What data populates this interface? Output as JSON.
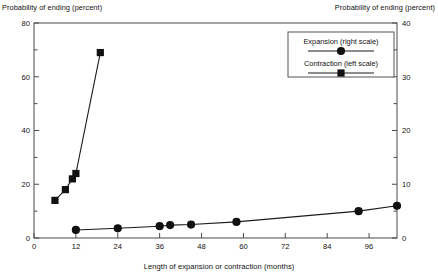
{
  "chart_data": {
    "type": "line",
    "title": "",
    "subtitle": "",
    "xlabel": "Length of expansion or contraction (months)",
    "ylabel_left": "Probability of ending (percent)",
    "ylabel_right": "Probability of ending (percent)",
    "xlim": [
      0,
      104
    ],
    "xticks": [
      0,
      12,
      24,
      36,
      48,
      60,
      72,
      84,
      96
    ],
    "xticklabels": [
      "0",
      "12",
      "24",
      "36",
      "48",
      "60",
      "72",
      "84",
      "96"
    ],
    "ylim_left": [
      0,
      80
    ],
    "yticks_left": [
      0,
      20,
      40,
      60,
      80
    ],
    "yticklabels_left": [
      "0",
      "20",
      "40",
      "60",
      "80"
    ],
    "yminor_left": [
      10,
      30,
      50,
      70
    ],
    "ylim_right": [
      0,
      40
    ],
    "yticks_right": [
      0,
      10,
      20,
      30,
      40
    ],
    "yticklabels_right": [
      "0",
      "10",
      "20",
      "30",
      "40"
    ],
    "yminor_right": [
      5,
      15,
      25,
      35
    ],
    "grid": false,
    "legend_position": "top-right",
    "series": [
      {
        "name": "Expansion (right scale)",
        "axis": "right",
        "marker": "circle",
        "x": [
          12,
          24,
          36,
          39,
          45,
          58,
          93,
          104
        ],
        "values": [
          1.5,
          1.8,
          2.2,
          2.4,
          2.5,
          3.0,
          5.0,
          6.0
        ]
      },
      {
        "name": "Contraction (left scale)",
        "axis": "left",
        "marker": "square",
        "x": [
          6,
          9,
          11,
          12,
          19
        ],
        "values": [
          14,
          18,
          22,
          24,
          69
        ]
      }
    ]
  },
  "legend": {
    "entries": [
      {
        "label": "Expansion (right scale)",
        "marker": "circle"
      },
      {
        "label": "Contraction (left scale)",
        "marker": "square"
      }
    ]
  },
  "axes": {
    "left_caption": "Probability of ending (percent)",
    "right_caption": "Probability of ending (percent)",
    "x_caption": "Length of expansion or contraction (months)"
  },
  "colors": {
    "marker": "#111111",
    "line": "#1a1a1a",
    "frame": "#4a4a4a",
    "background": "#ffffff"
  }
}
